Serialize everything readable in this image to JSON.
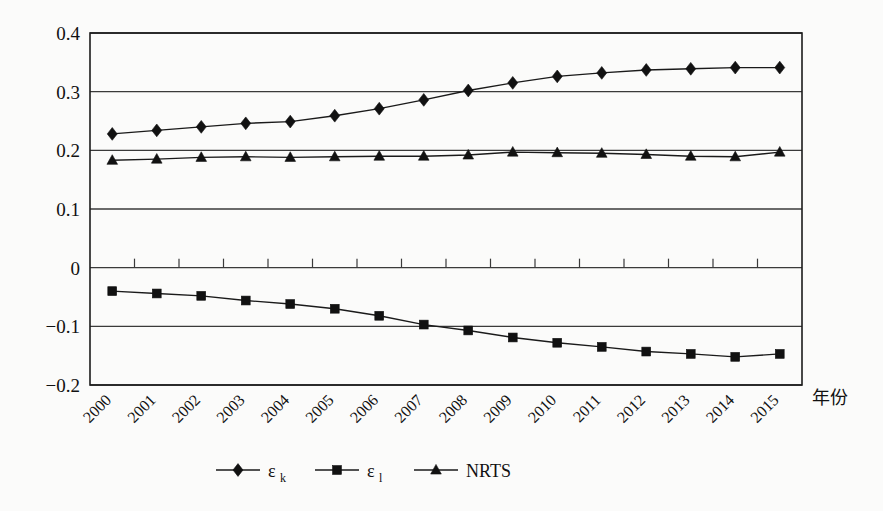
{
  "figure": {
    "background": "#fbfbfa",
    "ink_color": "#111111"
  },
  "chart_data": {
    "type": "line",
    "title": "",
    "subtitle": "",
    "xlabel": "年份",
    "ylabel": "",
    "xlim": [
      0,
      16
    ],
    "ylim": [
      -0.2,
      0.4
    ],
    "grid": true,
    "legend_position": "bottom",
    "categories": [
      "2000",
      "2001",
      "2002",
      "2003",
      "2004",
      "2005",
      "2006",
      "2007",
      "2008",
      "2009",
      "2010",
      "2011",
      "2012",
      "2013",
      "2014",
      "2015"
    ],
    "yticks": [
      "0.4",
      "0.3",
      "0.2",
      "0.1",
      "0",
      "-0.1",
      "-0.2"
    ],
    "ytick_values": [
      0.4,
      0.3,
      0.2,
      0.1,
      0,
      -0.1,
      -0.2
    ],
    "series": [
      {
        "name": "ε",
        "subscript": "k",
        "legend_label": "ε_k",
        "marker": "diamond",
        "color": "#111111",
        "values": [
          0.228,
          0.234,
          0.24,
          0.246,
          0.249,
          0.259,
          0.271,
          0.286,
          0.302,
          0.315,
          0.326,
          0.332,
          0.337,
          0.339,
          0.341,
          0.341
        ]
      },
      {
        "name": "ε",
        "subscript": "l",
        "legend_label": "ε_l",
        "marker": "square",
        "color": "#111111",
        "values": [
          -0.04,
          -0.044,
          -0.048,
          -0.056,
          -0.062,
          -0.07,
          -0.082,
          -0.097,
          -0.107,
          -0.119,
          -0.128,
          -0.135,
          -0.143,
          -0.147,
          -0.152,
          -0.147
        ]
      },
      {
        "name": "NRTS",
        "subscript": "",
        "legend_label": "NRTS",
        "marker": "triangle",
        "color": "#111111",
        "values": [
          0.183,
          0.185,
          0.188,
          0.189,
          0.188,
          0.189,
          0.19,
          0.19,
          0.192,
          0.197,
          0.196,
          0.195,
          0.193,
          0.19,
          0.189,
          0.197
        ]
      }
    ]
  },
  "legend": {
    "items": [
      {
        "label": "ε",
        "sub": "k",
        "marker": "diamond"
      },
      {
        "label": "ε",
        "sub": "l",
        "marker": "square"
      },
      {
        "label": "NRTS",
        "sub": "",
        "marker": "triangle"
      }
    ]
  }
}
